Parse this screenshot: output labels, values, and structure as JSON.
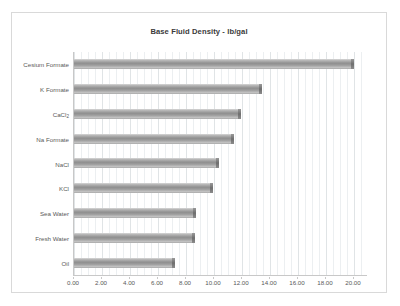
{
  "chart_data": {
    "type": "bar",
    "orientation": "horizontal",
    "title": "Base Fluid Density - lb/gal",
    "xlabel": "",
    "ylabel": "",
    "categories": [
      "Cesium Formate",
      "K Formate",
      "CaCl2",
      "Na Formate",
      "NaCl",
      "KCl",
      "Sea Water",
      "Fresh Water",
      "Oil"
    ],
    "category_labels_html": [
      "Cesium Formate",
      "K Formate",
      "CaCl<sub>2</sub>",
      "Na Formate",
      "NaCl",
      "KCl",
      "Sea Water",
      "Fresh Water",
      "Oil"
    ],
    "values": [
      19.95,
      13.4,
      11.9,
      11.4,
      10.3,
      9.9,
      8.7,
      8.6,
      7.2
    ],
    "xlim": [
      0,
      21.0
    ],
    "xticks": [
      0,
      2,
      4,
      6,
      8,
      10,
      12,
      14,
      16,
      18,
      20
    ],
    "xtick_labels": [
      "0.00",
      "2.00",
      "4.00",
      "6.00",
      "8.00",
      "10.00",
      "12.00",
      "14.00",
      "16.00",
      "18.00",
      "20.00"
    ],
    "minor_tick_step": 0.5,
    "grid": true,
    "grid_axis": "x",
    "legend": false,
    "bar_style": "cylinder-gray",
    "colors": {
      "bar_light": "#d8d8d8",
      "bar_mid": "#8f8f8f",
      "bar_edge": "#6e6e6e",
      "gridline": "#eceff1",
      "gridline_major": "#e0e4e6",
      "axis": "#c8c8c8",
      "text": "#595959",
      "title_text": "#3a3a3a",
      "frame_border": "#d9d9d9",
      "background": "#ffffff"
    }
  }
}
